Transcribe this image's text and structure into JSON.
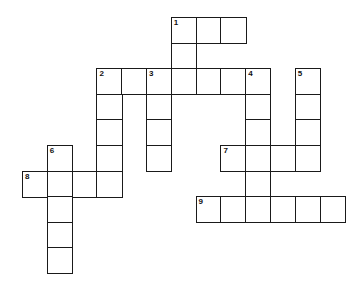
{
  "puzzle": {
    "type": "crossword",
    "cell_size": 25,
    "origin": {
      "x": 22,
      "y": 17
    },
    "cells": [
      {
        "r": 0,
        "c": 6,
        "n": "1"
      },
      {
        "r": 0,
        "c": 7
      },
      {
        "r": 0,
        "c": 8
      },
      {
        "r": 1,
        "c": 6
      },
      {
        "r": 2,
        "c": 3,
        "n": "2"
      },
      {
        "r": 2,
        "c": 4
      },
      {
        "r": 2,
        "c": 5,
        "n": "3"
      },
      {
        "r": 2,
        "c": 6
      },
      {
        "r": 2,
        "c": 7
      },
      {
        "r": 2,
        "c": 8
      },
      {
        "r": 2,
        "c": 9,
        "n": "4"
      },
      {
        "r": 2,
        "c": 11,
        "n": "5"
      },
      {
        "r": 3,
        "c": 3
      },
      {
        "r": 3,
        "c": 5
      },
      {
        "r": 3,
        "c": 9
      },
      {
        "r": 3,
        "c": 11
      },
      {
        "r": 4,
        "c": 3
      },
      {
        "r": 4,
        "c": 5
      },
      {
        "r": 4,
        "c": 9
      },
      {
        "r": 4,
        "c": 11
      },
      {
        "r": 5,
        "c": 1,
        "n": "6"
      },
      {
        "r": 5,
        "c": 3
      },
      {
        "r": 5,
        "c": 5
      },
      {
        "r": 5,
        "c": 8,
        "n": "7"
      },
      {
        "r": 5,
        "c": 9
      },
      {
        "r": 5,
        "c": 10
      },
      {
        "r": 5,
        "c": 11
      },
      {
        "r": 6,
        "c": 0,
        "n": "8"
      },
      {
        "r": 6,
        "c": 1
      },
      {
        "r": 6,
        "c": 2
      },
      {
        "r": 6,
        "c": 3
      },
      {
        "r": 6,
        "c": 9
      },
      {
        "r": 7,
        "c": 1
      },
      {
        "r": 7,
        "c": 7,
        "n": "9"
      },
      {
        "r": 7,
        "c": 8
      },
      {
        "r": 7,
        "c": 9
      },
      {
        "r": 7,
        "c": 10
      },
      {
        "r": 7,
        "c": 11
      },
      {
        "r": 7,
        "c": 12
      },
      {
        "r": 8,
        "c": 1
      },
      {
        "r": 9,
        "c": 1
      }
    ],
    "clue_numbers": [
      "1",
      "2",
      "3",
      "4",
      "5",
      "6",
      "7",
      "8",
      "9"
    ]
  }
}
